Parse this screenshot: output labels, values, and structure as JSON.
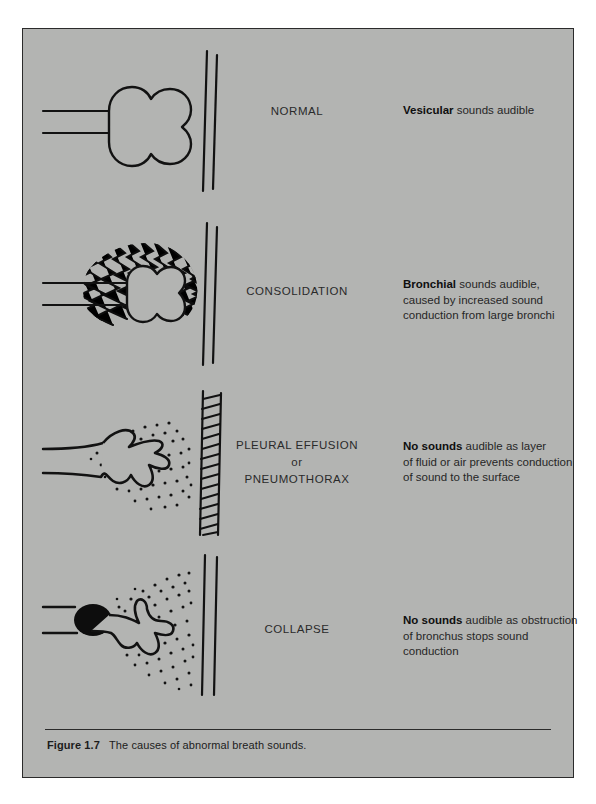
{
  "figure": {
    "caption_label": "Figure 1.7",
    "caption_text": "The causes of abnormal breath sounds.",
    "background_color": "#b3b4b2",
    "ink_color": "#1c1c1c"
  },
  "rows": [
    {
      "id": "normal",
      "condition_label": "NORMAL",
      "diagram_name": "normal-lung-diagram",
      "description_bold": "Vesicular",
      "description_rest": " sounds audible",
      "description_lines": [
        "Vesicular sounds audible"
      ]
    },
    {
      "id": "consolidation",
      "condition_label": "CONSOLIDATION",
      "diagram_name": "consolidation-lung-diagram",
      "description_bold": "Bronchial",
      "description_rest": " sounds audible,",
      "description_lines": [
        "Bronchial sounds audible,",
        "caused by increased sound",
        "conduction from large bronchi"
      ],
      "description_line2": "caused by increased sound",
      "description_line3": "conduction from large bronchi"
    },
    {
      "id": "effusion",
      "condition_label_line1": "PLEURAL EFFUSION",
      "condition_label_line2": "or",
      "condition_label_line3": "PNEUMOTHORAX",
      "diagram_name": "pleural-effusion-lung-diagram",
      "description_bold": "No sounds",
      "description_rest": " audible as layer",
      "description_lines": [
        "No sounds audible as layer",
        "of fluid or air prevents conduction",
        "of sound to the surface"
      ],
      "description_line2": "of fluid or air prevents conduction",
      "description_line3": "of sound to the surface"
    },
    {
      "id": "collapse",
      "condition_label": "COLLAPSE",
      "diagram_name": "collapse-lung-diagram",
      "description_bold": "No sounds",
      "description_rest": " audible as obstruction",
      "description_lines": [
        "No sounds audible as obstruction",
        "of bronchus stops sound",
        "conduction"
      ],
      "description_line2": "of bronchus stops sound",
      "description_line3": "conduction"
    }
  ]
}
